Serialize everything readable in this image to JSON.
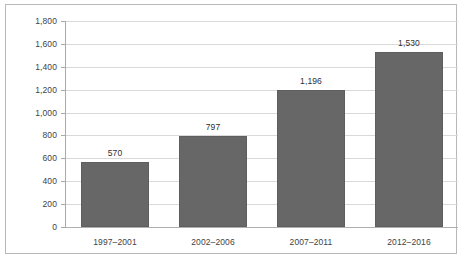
{
  "chart_data": {
    "type": "bar",
    "title": "",
    "subtitle": "",
    "xlabel": "",
    "ylabel": "",
    "categories": [
      "1997–2001",
      "2002–2006",
      "2007–2011",
      "2012–2016"
    ],
    "values": [
      570,
      797,
      1196,
      1530
    ],
    "value_labels": [
      "570",
      "797",
      "1,196",
      "1,530"
    ],
    "ylim": [
      0,
      1800
    ],
    "ytick_step": 200,
    "ytick_labels": [
      "1,800",
      "1,600",
      "1,400",
      "1,200",
      "1,000",
      "800",
      "600",
      "400",
      "200",
      "0"
    ],
    "ytick_values": [
      1800,
      1600,
      1400,
      1200,
      1000,
      800,
      600,
      400,
      200,
      0
    ],
    "grid": true,
    "grid_axis": "y",
    "legend": false,
    "legend_position": "none",
    "series": [
      {
        "name": "",
        "values": [
          570,
          797,
          1196,
          1530
        ]
      }
    ],
    "colors": {
      "bar_fill": "#676767",
      "bar_border": "#5e5e5e",
      "gridline": "#d9d9d9",
      "axis_line": "#a9a9a9",
      "frame_border": "#b8b8b8",
      "label_text": "#3f3f3f",
      "background": "#ffffff"
    }
  }
}
